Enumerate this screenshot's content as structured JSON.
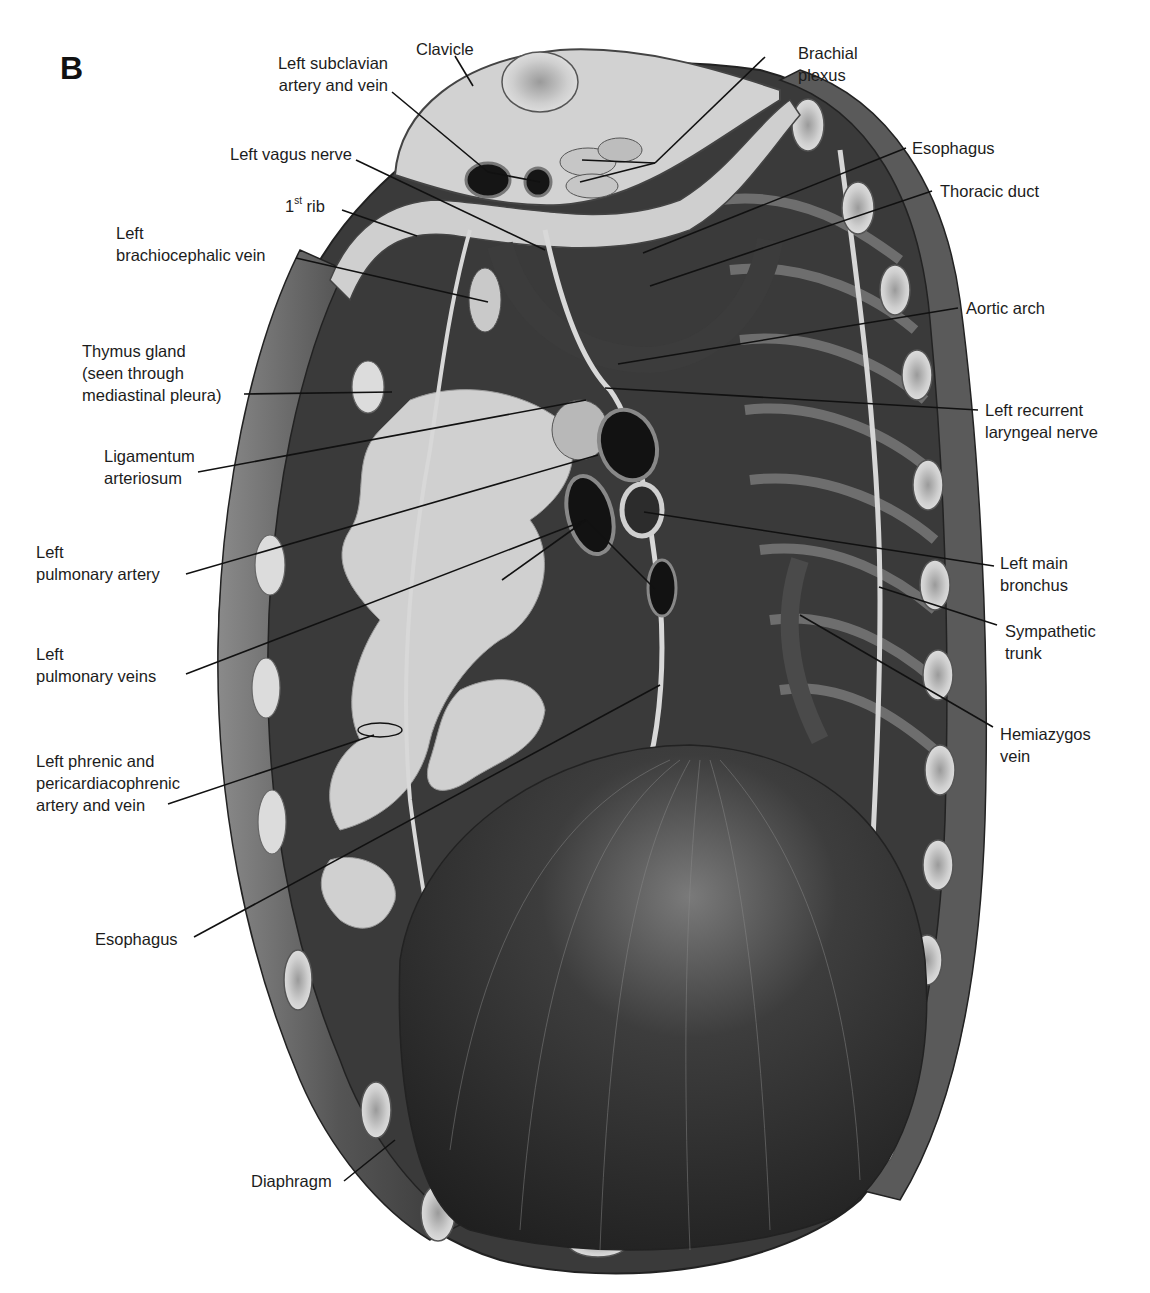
{
  "figure": {
    "panel_letter": "B",
    "labels": [
      {
        "id": "clavicle",
        "text": "Clavicle",
        "x": 416,
        "y": 38,
        "align": "left",
        "leader": [
          [
            455,
            56
          ],
          [
            473,
            86
          ]
        ]
      },
      {
        "id": "left-subclavian",
        "text": "Left subclavian\nartery and vein",
        "x": 248,
        "y": 52,
        "align": "right",
        "w": 140,
        "leader": [
          [
            392,
            92
          ],
          [
            488,
            172
          ],
          [
            540,
            182
          ]
        ]
      },
      {
        "id": "brachial-plexus",
        "text": "Brachial\nplexus",
        "x": 798,
        "y": 42,
        "align": "left",
        "leader": [
          [
            765,
            57
          ],
          [
            655,
            163
          ],
          [
            582,
            160
          ],
          [
            580,
            182
          ]
        ]
      },
      {
        "id": "left-vagus",
        "text": "Left vagus nerve",
        "x": 212,
        "y": 143,
        "align": "right",
        "w": 140,
        "leader": [
          [
            356,
            160
          ],
          [
            545,
            250
          ]
        ]
      },
      {
        "id": "esophagus-top",
        "text": "Esophagus",
        "x": 912,
        "y": 137,
        "align": "left",
        "leader": [
          [
            906,
            148
          ],
          [
            643,
            253
          ]
        ]
      },
      {
        "id": "thoracic-duct",
        "text": "Thoracic duct",
        "x": 940,
        "y": 180,
        "align": "left",
        "leader": [
          [
            932,
            191
          ],
          [
            650,
            286
          ]
        ]
      },
      {
        "id": "first-rib",
        "text": "1ˢᵗ rib",
        "sup": "st",
        "base": "1",
        "rest": " rib",
        "x": 285,
        "y": 195,
        "align": "left",
        "leader": [
          [
            342,
            210
          ],
          [
            417,
            236
          ]
        ]
      },
      {
        "id": "left-brachiocephalic",
        "text": "Left\nbrachiocephalic vein",
        "x": 116,
        "y": 222,
        "align": "left",
        "leader": [
          [
            296,
            258
          ],
          [
            488,
            302
          ]
        ]
      },
      {
        "id": "aortic-arch",
        "text": "Aortic arch",
        "x": 966,
        "y": 297,
        "align": "left",
        "leader": [
          [
            958,
            308
          ],
          [
            618,
            364
          ]
        ]
      },
      {
        "id": "thymus",
        "text": "Thymus gland\n(seen through\nmediastinal pleura)",
        "x": 82,
        "y": 340,
        "align": "left",
        "leader": [
          [
            244,
            394
          ],
          [
            392,
            392
          ]
        ]
      },
      {
        "id": "left-recurrent-laryngeal",
        "text": "Left recurrent\nlaryngeal nerve",
        "x": 985,
        "y": 399,
        "align": "left",
        "leader": [
          [
            978,
            410
          ],
          [
            605,
            388
          ]
        ]
      },
      {
        "id": "ligamentum-arteriosum",
        "text": "Ligamentum\narteriosum",
        "x": 104,
        "y": 445,
        "align": "left",
        "leader": [
          [
            198,
            472
          ],
          [
            586,
            400
          ]
        ]
      },
      {
        "id": "left-pulmonary-artery",
        "text": "Left\npulmonary artery",
        "x": 36,
        "y": 541,
        "align": "left",
        "leader": [
          [
            186,
            574
          ],
          [
            598,
            455
          ]
        ]
      },
      {
        "id": "left-main-bronchus",
        "text": "Left main\nbronchus",
        "x": 1000,
        "y": 552,
        "align": "left",
        "leader": [
          [
            994,
            566
          ],
          [
            644,
            512
          ]
        ]
      },
      {
        "id": "sympathetic-trunk",
        "text": "Sympathetic\ntrunk",
        "x": 1005,
        "y": 620,
        "align": "left",
        "leader": [
          [
            997,
            625
          ],
          [
            879,
            587
          ]
        ]
      },
      {
        "id": "left-pulmonary-veins",
        "text": "Left\npulmonary veins",
        "x": 36,
        "y": 643,
        "align": "left",
        "leader": [
          [
            186,
            674
          ],
          [
            586,
            520
          ],
          [
            502,
            580
          ],
          [
            655,
            589
          ]
        ]
      },
      {
        "id": "hemiazygos",
        "text": "Hemiazygos\nvein",
        "x": 1000,
        "y": 723,
        "align": "left",
        "leader": [
          [
            993,
            727
          ],
          [
            800,
            615
          ]
        ]
      },
      {
        "id": "left-phrenic",
        "text": "Left phrenic and\npericardiacophrenic\nartery and vein",
        "x": 36,
        "y": 750,
        "align": "left",
        "leader": [
          [
            168,
            804
          ],
          [
            374,
            735
          ]
        ]
      },
      {
        "id": "esophagus-bottom",
        "text": "Esophagus",
        "x": 95,
        "y": 928,
        "align": "left",
        "leader": [
          [
            194,
            937
          ],
          [
            660,
            685
          ]
        ]
      },
      {
        "id": "diaphragm",
        "text": "Diaphragm",
        "x": 251,
        "y": 1170,
        "align": "left",
        "leader": [
          [
            344,
            1181
          ],
          [
            395,
            1140
          ]
        ]
      }
    ]
  },
  "colors": {
    "background": "#ffffff",
    "cavity_dark": "#2a2a2a",
    "wall_mid": "#6e6e6e",
    "bone_light": "#d8d8d8",
    "lung_pale": "#cfcfcf",
    "leader": "#111111",
    "text": "#1c1c1c"
  }
}
